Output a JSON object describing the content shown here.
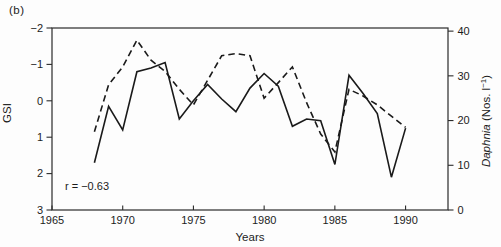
{
  "figure": {
    "panel_label": "(b)"
  },
  "chart_data": {
    "type": "line",
    "title": "",
    "xlabel": "Years",
    "x_ticks": [
      1965,
      1970,
      1975,
      1980,
      1985,
      1990
    ],
    "x_range": [
      1965,
      1993
    ],
    "grid": false,
    "legend": false,
    "annotation": "r = −0.63",
    "line_color": "#1a1a1a",
    "axis_color": "#2b2b2b",
    "left_axis": {
      "label": "GSI",
      "ticks": [
        -2,
        -1,
        0,
        1,
        2,
        3
      ],
      "range": [
        -2,
        3
      ],
      "inverted": true
    },
    "right_axis": {
      "label_italic": "Daphnia",
      "label_unit": "(Nos. l",
      "label_superscript": "−1",
      "label_close": ")",
      "ticks": [
        40,
        30,
        20,
        10,
        0
      ],
      "range": [
        0,
        40.7
      ]
    },
    "series": [
      {
        "name": "GSI",
        "axis": "left",
        "line_style": "solid",
        "x": [
          1968,
          1969,
          1970,
          1971,
          1972,
          1973,
          1974,
          1975,
          1976,
          1977,
          1978,
          1979,
          1980,
          1981,
          1982,
          1983,
          1984,
          1985,
          1986,
          1987,
          1988,
          1989,
          1990
        ],
        "values": [
          1.7,
          0.15,
          0.8,
          -0.8,
          -0.9,
          -1.05,
          0.5,
          0.0,
          -0.45,
          -0.05,
          0.3,
          -0.35,
          -0.75,
          -0.4,
          0.7,
          0.5,
          0.55,
          1.75,
          -0.7,
          -0.2,
          0.35,
          2.1,
          0.75
        ]
      },
      {
        "name": "Daphnia",
        "axis": "right",
        "line_style": "dashed",
        "x": [
          1968,
          1969,
          1970,
          1971,
          1972,
          1973,
          1974,
          1975,
          1976,
          1977,
          1978,
          1979,
          1980,
          1981,
          1982,
          1983,
          1984,
          1985,
          1986,
          1987,
          1988,
          1989,
          1990
        ],
        "values": [
          17.5,
          28,
          32,
          38,
          33.5,
          31,
          27,
          23.5,
          29,
          34.5,
          35,
          34.5,
          25,
          28.5,
          32,
          24,
          17,
          13,
          27,
          25.5,
          23.5,
          21,
          18.5
        ]
      }
    ]
  }
}
